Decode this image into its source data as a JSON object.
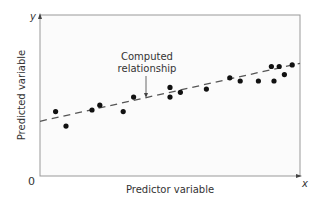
{
  "chart_data": {
    "type": "scatter",
    "title": "",
    "xlabel": "Predictor variable",
    "ylabel": "Predicted variable",
    "x_axis_letter": "x",
    "y_axis_letter": "y",
    "origin_label": "0",
    "annotation": "Computed relationship",
    "annotation_lines": [
      "Computed",
      "relationship"
    ],
    "grid": false,
    "legend": null,
    "xlim": [
      0,
      100
    ],
    "ylim": [
      0,
      100
    ],
    "points": [
      {
        "x": 6,
        "y": 40
      },
      {
        "x": 10,
        "y": 31
      },
      {
        "x": 20,
        "y": 41
      },
      {
        "x": 23,
        "y": 44
      },
      {
        "x": 32,
        "y": 40
      },
      {
        "x": 36,
        "y": 49
      },
      {
        "x": 50,
        "y": 55
      },
      {
        "x": 50,
        "y": 49
      },
      {
        "x": 54,
        "y": 52
      },
      {
        "x": 64,
        "y": 54
      },
      {
        "x": 73,
        "y": 61
      },
      {
        "x": 77,
        "y": 59
      },
      {
        "x": 84,
        "y": 59
      },
      {
        "x": 89,
        "y": 68
      },
      {
        "x": 90,
        "y": 59
      },
      {
        "x": 92,
        "y": 68
      },
      {
        "x": 94,
        "y": 63
      },
      {
        "x": 97,
        "y": 69
      }
    ],
    "fit_line": {
      "style": "dashed",
      "x": [
        0,
        100
      ],
      "y": [
        34,
        70
      ]
    }
  },
  "colors": {
    "axis": "#888888",
    "points": "#111111",
    "line": "#555555",
    "plot_bg": "#fafafa"
  }
}
